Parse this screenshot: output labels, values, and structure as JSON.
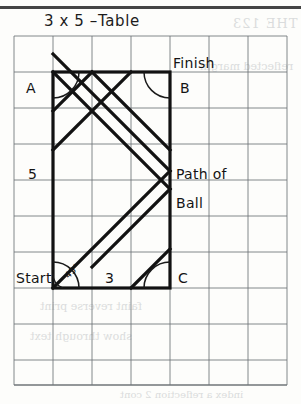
{
  "title": "3 x 5 –Table",
  "figure": {
    "type": "billiard-path-diagram",
    "grid": {
      "x0": 14,
      "y0": 36,
      "cell": 39,
      "rowcell": 36,
      "cols": 7,
      "rows": 9.7,
      "line_color": "#6f7479"
    },
    "table_rect": {
      "x": 53,
      "y": 72,
      "w": 117,
      "h": 216,
      "cols": 3,
      "rows": 6,
      "stroke": "#121212",
      "stroke_width": 3.2
    },
    "path": {
      "stroke": "#121212",
      "stroke_width": 3.2,
      "angle_label": "45°",
      "points": [
        [
          53,
          288
        ],
        [
          131,
          210
        ],
        [
          53,
          132
        ],
        [
          92,
          93
        ],
        [
          92,
          93
        ],
        [
          170,
          171
        ],
        [
          131,
          210
        ]
      ],
      "segments": [
        [
          53,
          288,
          170,
          171
        ],
        [
          170,
          171,
          53,
          54
        ],
        [
          53,
          72,
          170,
          189
        ],
        [
          170,
          189,
          92,
          267
        ],
        [
          92,
          72,
          53,
          111
        ],
        [
          131,
          288,
          170,
          249
        ],
        [
          92,
          72,
          170,
          150
        ],
        [
          53,
          150,
          131,
          72
        ]
      ]
    },
    "corner_arcs": [
      {
        "name": "arc-top-left",
        "cx": 53,
        "cy": 72,
        "r": 26,
        "from": 0,
        "to": 90
      },
      {
        "name": "arc-top-right",
        "cx": 170,
        "cy": 72,
        "r": 26,
        "from": 90,
        "to": 180
      },
      {
        "name": "arc-bottom-left",
        "cx": 53,
        "cy": 288,
        "r": 26,
        "from": 270,
        "to": 360
      },
      {
        "name": "arc-bottom-right",
        "cx": 170,
        "cy": 288,
        "r": 26,
        "from": 180,
        "to": 270
      }
    ],
    "labels": {
      "corner_a": {
        "text": "A",
        "x": 26,
        "y": 80
      },
      "corner_b": {
        "text": "B",
        "x": 180,
        "y": 80
      },
      "corner_c": {
        "text": "C",
        "x": 178,
        "y": 270
      },
      "finish": {
        "text": "Finish",
        "x": 173,
        "y": 55
      },
      "start": {
        "text": "Start",
        "x": 16,
        "y": 270
      },
      "side_5": {
        "text": "5",
        "x": 28,
        "y": 166
      },
      "side_3": {
        "text": "3",
        "x": 105,
        "y": 270
      },
      "path_of": {
        "text": "Path  of",
        "x": 176,
        "y": 166
      },
      "ball": {
        "text": "Ball",
        "x": 176,
        "y": 195
      },
      "angle": {
        "text": "45°",
        "x": 64,
        "y": 266
      }
    }
  },
  "ghost_text": {
    "line1": "THE 123",
    "line2": "reflected margin",
    "line3": "faint reverse print",
    "line4": "show through text",
    "line5": "index  a  reflection  2 cont"
  }
}
